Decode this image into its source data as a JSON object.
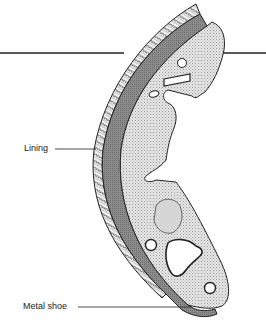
{
  "diagram": {
    "labels": {
      "lining": "Lining",
      "metal_shoe": "Metal shoe"
    },
    "colors": {
      "background": "#ffffff",
      "outline": "#222222",
      "lining_band": "#8a8a8a",
      "web_plate": "#d9d9d9",
      "friction_texture": "#f2f2f2"
    }
  }
}
